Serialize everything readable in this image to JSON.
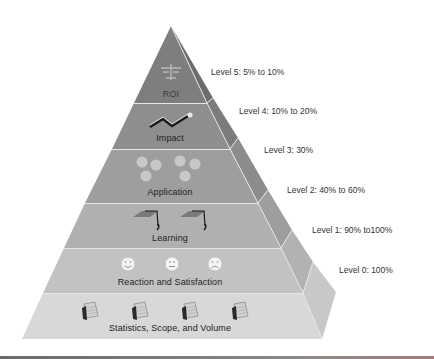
{
  "diagram": {
    "type": "pyramid",
    "layers": [
      {
        "id": "roi",
        "label": "ROI",
        "icon": "scales-icon",
        "level": "Level 5: 5% to 10%",
        "color": "#7e7e7e",
        "side_color": "#6a6a6a"
      },
      {
        "id": "impact",
        "label": "Impact",
        "icon": "trend-arrow-icon",
        "level": "Level 4: 10% to 20%",
        "color": "#8e8e8e",
        "side_color": "#7a7a7a"
      },
      {
        "id": "application",
        "label": "Application",
        "icon": "gears-icon",
        "level": "Level 3: 30%",
        "color": "#9e9e9e",
        "side_color": "#8a8a8a"
      },
      {
        "id": "learning",
        "label": "Learning",
        "icon": "graduation-cap-icon",
        "level": "Level 2: 40% to 60%",
        "color": "#b0b0b0",
        "side_color": "#9c9c9c"
      },
      {
        "id": "reaction",
        "label": "Reaction and Satisfaction",
        "icon": "smiley-faces-icon",
        "level": "Level 1: 90% to100%",
        "color": "#c2c2c2",
        "side_color": "#b0b0b0"
      },
      {
        "id": "statistics",
        "label": "Statistics, Scope, and Volume",
        "icon": "calendar-icon",
        "level": "Level 0: 100%",
        "color": "#d6d6d6",
        "side_color": "#c6c6c6"
      }
    ]
  }
}
